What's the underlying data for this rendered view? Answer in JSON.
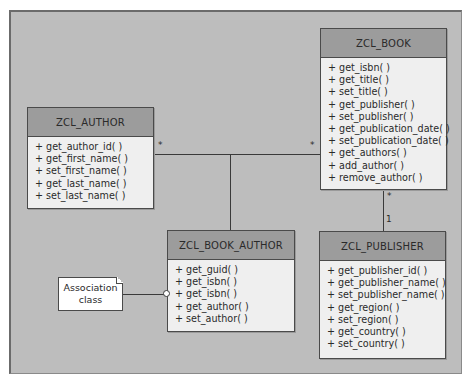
{
  "diagram": {
    "type": "UML class diagram",
    "classes": {
      "book": {
        "name": "ZCL_BOOK",
        "methods": [
          "+ get_isbn( )",
          "+ get_title( )",
          "+ set_title( )",
          "+ get_publisher( )",
          "+ set_publisher( )",
          "+ get_publication_date( )",
          "+ set_publication_date( )",
          "+ get_authors( )",
          "+ add_author( )",
          "+ remove_author( )"
        ]
      },
      "author": {
        "name": "ZCL_AUTHOR",
        "methods": [
          "+ get_author_id( )",
          "+ get_first_name( )",
          "+ set_first_name( )",
          "+ get_last_name( )",
          "+ set_last_name( )"
        ]
      },
      "book_author": {
        "name": "ZCL_BOOK_AUTHOR",
        "methods": [
          "+ get_guid( )",
          "+ get_isbn( )",
          "+ get_isbn( )",
          "+ get_author( )",
          "+ set_author( )"
        ]
      },
      "publisher": {
        "name": "ZCL_PUBLISHER",
        "methods": [
          "+ get_publisher_id( )",
          "+ get_publisher_name( )",
          "+ set_publisher_name( )",
          "+ get_region( )",
          "+ set_region( )",
          "+ get_country( )",
          "+ set_country( )"
        ]
      }
    },
    "associations": {
      "author_book": {
        "author_end": "*",
        "book_end": "*"
      },
      "book_publisher": {
        "book_end": "*",
        "publisher_end": "1"
      }
    },
    "note": {
      "line1": "Association",
      "line2": "class"
    },
    "colors": {
      "background": "#bdbdbd",
      "header": "#9c9c9c",
      "body": "#efefef",
      "border": "#4a4a4a"
    }
  }
}
